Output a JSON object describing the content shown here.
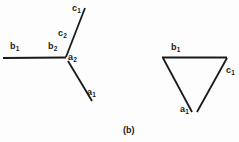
{
  "figure": {
    "caption": "(b)",
    "background_color": "#fdfdfd",
    "stroke_color": "#1a1a1a",
    "panels": [
      {
        "name": "open-chain-diagram",
        "description": "left diagram: horizontal segment joined to an upward slanted segment and a downward slanted segment",
        "strokes": [
          {
            "name": "segment-b",
            "x1": 3,
            "y1": 58,
            "x2": 66,
            "y2": 57.5,
            "width": 2.2
          },
          {
            "name": "segment-c",
            "x1": 66,
            "y1": 57,
            "x2": 85,
            "y2": 8,
            "width": 1.8
          },
          {
            "name": "segment-a",
            "x1": 68,
            "y1": 61,
            "x2": 92,
            "y2": 101,
            "width": 1.8
          }
        ],
        "labels": [
          {
            "name": "label-b1",
            "base": "b",
            "sub": "1",
            "x": 10,
            "y": 42
          },
          {
            "name": "label-b2",
            "base": "b",
            "sub": "2",
            "x": 48,
            "y": 42
          },
          {
            "name": "label-c1",
            "base": "c",
            "sub": "1",
            "x": 72,
            "y": 4
          },
          {
            "name": "label-c2",
            "base": "c",
            "sub": "2",
            "x": 58,
            "y": 29
          },
          {
            "name": "label-a2",
            "base": "a",
            "sub": "2",
            "x": 68,
            "y": 53
          },
          {
            "name": "label-a1",
            "base": "a",
            "sub": "1",
            "x": 87,
            "y": 88
          }
        ]
      },
      {
        "name": "triangle-diagram",
        "description": "right diagram: downward pointing triangle with a small gap at the bottom vertex",
        "strokes": [
          {
            "name": "triangle-top-edge",
            "x1": 162,
            "y1": 57.5,
            "x2": 227,
            "y2": 57.5,
            "width": 2.2
          },
          {
            "name": "triangle-left-edge",
            "x1": 163,
            "y1": 58,
            "x2": 192,
            "y2": 112,
            "width": 1.8
          },
          {
            "name": "triangle-right-edge",
            "x1": 227,
            "y1": 58,
            "x2": 197,
            "y2": 112,
            "width": 1.8
          }
        ],
        "labels": [
          {
            "name": "label-b1",
            "base": "b",
            "sub": "1",
            "x": 171,
            "y": 43
          },
          {
            "name": "label-c1",
            "base": "c",
            "sub": "1",
            "x": 226,
            "y": 66
          },
          {
            "name": "label-a1",
            "base": "a",
            "sub": "1",
            "x": 180,
            "y": 105
          }
        ]
      }
    ],
    "caption_position": {
      "x": 123,
      "y": 126
    }
  }
}
